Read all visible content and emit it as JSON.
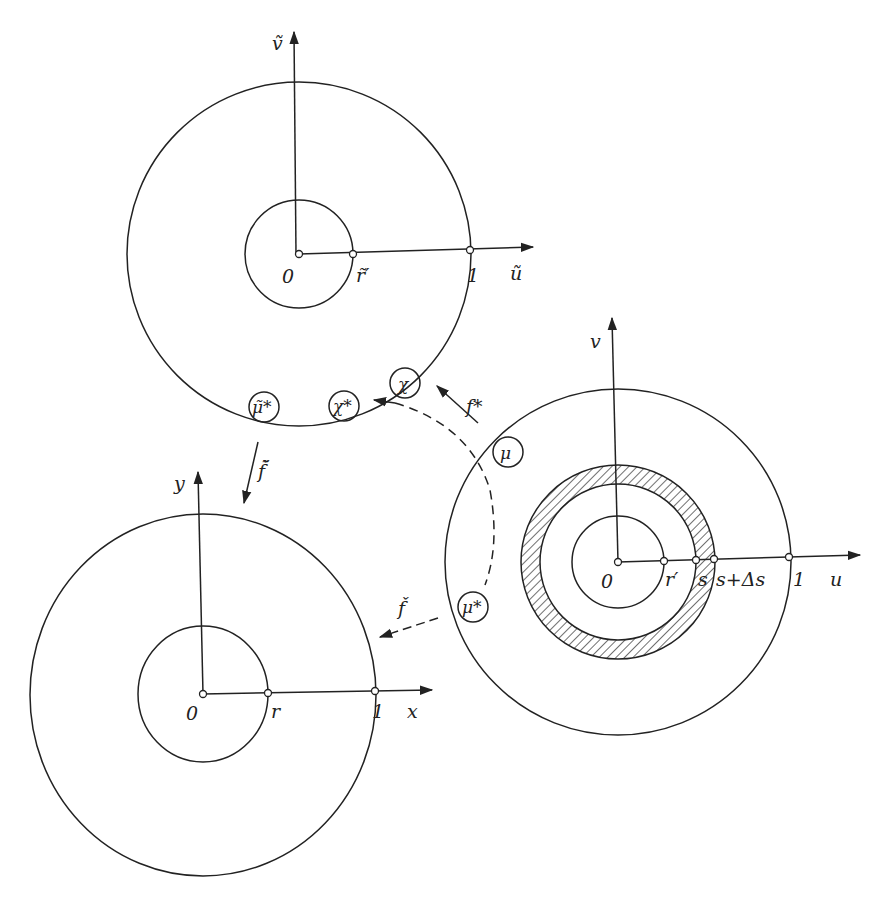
{
  "diagram": {
    "type": "annulus-mappings",
    "stroke_color": "#222222",
    "background": "#ffffff",
    "annuli": [
      {
        "id": "top",
        "center": [
          299,
          254
        ],
        "outer_radius": 173,
        "inner_radius": 54,
        "labels": {
          "origin": "0",
          "inner": "r̃′",
          "outer": "1",
          "x_axis": "ũ",
          "y_axis": "ṽ"
        }
      },
      {
        "id": "right",
        "center": [
          618,
          562
        ],
        "outer_radius": 173,
        "inner_radius": 46,
        "ring_inner_radius": 78,
        "ring_outer_radius": 97,
        "labels": {
          "origin": "0",
          "inner": "r′",
          "s": "s",
          "s_ds": "s+Δs",
          "outer": "1",
          "x_axis": "u",
          "y_axis": "v"
        }
      },
      {
        "id": "left",
        "center": [
          203,
          694
        ],
        "outer_radius": 174,
        "inner_radius": 65,
        "labels": {
          "origin": "0",
          "inner": "r",
          "outer": "1",
          "x_axis": "x",
          "y_axis": "y"
        }
      }
    ],
    "region_labels": {
      "chi": "χ",
      "chi_star": "χ*",
      "mu_tilde_star": "μ̃*",
      "mu": "μ",
      "mu_star": "μ*"
    },
    "maps": {
      "f_star": "f*",
      "f_check_tilde": "f̌̃",
      "f_check": "f̌"
    }
  }
}
